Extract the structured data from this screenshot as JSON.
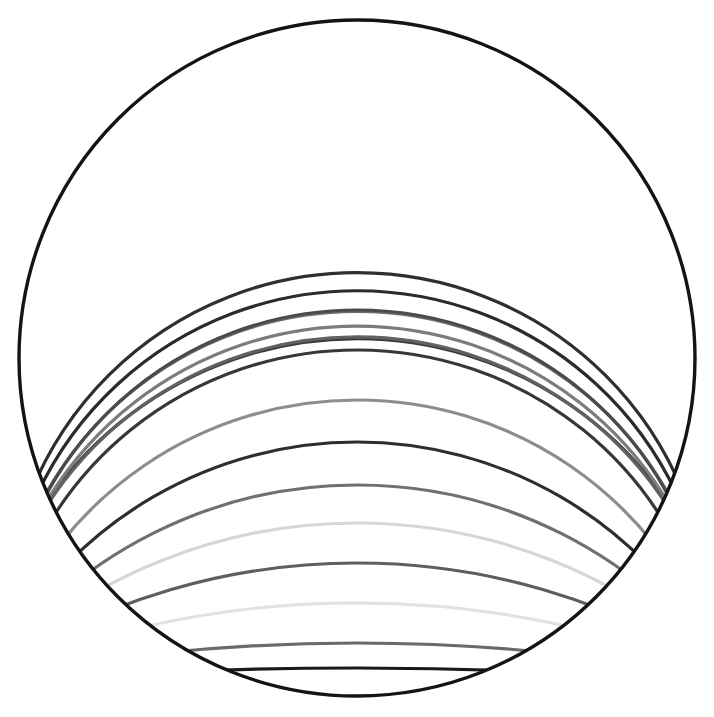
{
  "figure": {
    "type": "geometric-line-figure",
    "canvas": {
      "width": 714,
      "height": 717,
      "background": "#ffffff"
    },
    "outer_circle": {
      "name": "bounding-circle",
      "cx": 357,
      "cy": 358,
      "r": 338,
      "stroke": "#141414",
      "stroke_width": 3.4,
      "fill": "none"
    },
    "arc_common": {
      "description": "Each arc is a circular arc whose apex lies on the vertical center line and whose ends run out to the left and right edges of the bounding circle; arcs are clipped by the bounding circle.",
      "x_left": 19,
      "x_right": 695,
      "stroke_width": 3.2,
      "fill": "none",
      "linecap": "round"
    },
    "arcs": [
      {
        "index": 1,
        "apex_y": 73,
        "sweep_y": 352,
        "color": "#3c3c3c"
      },
      {
        "index": 2,
        "apex_y": 112,
        "sweep_y": 364,
        "color": "#616161"
      },
      {
        "index": 3,
        "apex_y": 153,
        "sweep_y": 372,
        "color": "#7c7c7c"
      },
      {
        "index": 4,
        "apex_y": 195,
        "sweep_y": 380,
        "color": "#6e6e6e"
      },
      {
        "index": 5,
        "apex_y": 235,
        "sweep_y": 386,
        "color": "#2b2b2b"
      },
      {
        "index": 6,
        "apex_y": 273,
        "sweep_y": 392,
        "color": "#2f2f2f"
      },
      {
        "index": 7,
        "apex_y": 310,
        "sweep_y": 398,
        "color": "#4b4b4b"
      },
      {
        "index": 8,
        "apex_y": 350,
        "sweep_y": 404,
        "color": "#373737"
      },
      {
        "index": 9,
        "apex_y": 400,
        "sweep_y": 410,
        "color": "#8d8d8d"
      },
      {
        "index": 10,
        "apex_y": 442,
        "sweep_y": 416,
        "color": "#2e2e2e"
      },
      {
        "index": 11,
        "apex_y": 485,
        "sweep_y": 422,
        "color": "#707070"
      },
      {
        "index": 12,
        "apex_y": 523,
        "sweep_y": 428,
        "color": "#d6d6d6"
      },
      {
        "index": 13,
        "apex_y": 563,
        "sweep_y": 434,
        "color": "#5e5e5e"
      },
      {
        "index": 14,
        "apex_y": 603,
        "sweep_y": 440,
        "color": "#e2e2e2"
      },
      {
        "index": 15,
        "apex_y": 643,
        "sweep_y": 446,
        "color": "#6a6a6a"
      },
      {
        "index": 16,
        "apex_y": 668,
        "sweep_y": 452,
        "color": "#1a1a1a"
      }
    ],
    "palette": {
      "ink": "#141414",
      "background": "#ffffff"
    }
  }
}
